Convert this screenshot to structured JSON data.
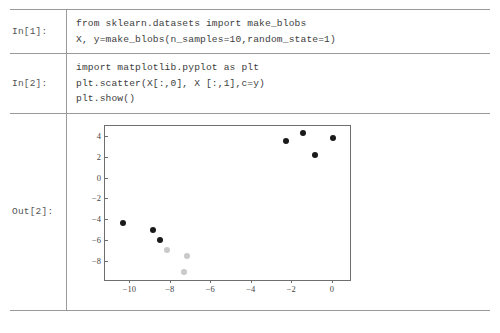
{
  "notebook": {
    "cells": [
      {
        "prompt": "In[1]:",
        "lines": [
          "from sklearn.datasets import make_blobs",
          "X, y=make_blobs(n_samples=10,random_state=1)"
        ]
      },
      {
        "prompt": "In[2]:",
        "lines": [
          "import matplotlib.pyplot as plt",
          "plt.scatter(X[:,0], X [:,1],c=y)",
          "plt.show()"
        ]
      },
      {
        "prompt": "Out[2]:",
        "lines": []
      }
    ]
  },
  "chart_data": {
    "type": "scatter",
    "title": "",
    "xlabel": "",
    "ylabel": "",
    "xlim": [
      -11.2,
      0.9
    ],
    "ylim": [
      -9.8,
      5.0
    ],
    "xticks": [
      -10,
      -8,
      -6,
      -4,
      -2,
      0
    ],
    "yticks": [
      4,
      2,
      0,
      -2,
      -4,
      -6,
      -8
    ],
    "xticklabels": [
      "−10",
      "−8",
      "−6",
      "−4",
      "−2",
      "0"
    ],
    "yticklabels": [
      "4",
      "2",
      "0",
      "−2",
      "−4",
      "−6",
      "−8"
    ],
    "grid": false,
    "legend": false,
    "marker_size_px": 6,
    "series": [
      {
        "name": "class 0",
        "color": "#1a1a1a",
        "points": [
          [
            -2.25,
            3.5
          ],
          [
            -1.4,
            4.3
          ],
          [
            -0.85,
            2.2
          ],
          [
            0.05,
            3.8
          ],
          [
            -10.3,
            -4.35
          ],
          [
            -8.85,
            -5.05
          ],
          [
            -8.5,
            -6.0
          ]
        ]
      },
      {
        "name": "class 1",
        "color": "#c9c9c9",
        "points": [
          [
            -8.15,
            -7.0
          ],
          [
            -7.15,
            -7.55
          ],
          [
            -7.3,
            -9.1
          ]
        ]
      }
    ]
  }
}
